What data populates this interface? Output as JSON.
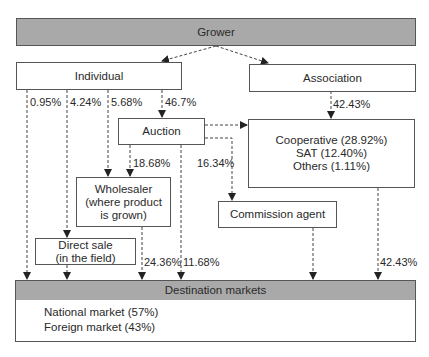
{
  "nodes": {
    "grower": "Grower",
    "individual": "Individual",
    "association": "Association",
    "auction": "Auction",
    "cooperative": [
      "Cooperative (28.92%)",
      "SAT (12.40%)",
      "Others (1.11%)"
    ],
    "wholesaler": [
      "Wholesaler",
      "(where product",
      "is grown)"
    ],
    "commission_agent": "Commission agent",
    "direct_sale": [
      "Direct sale",
      "(in the field)"
    ],
    "destination": "Destination markets",
    "markets": [
      "National market (57%)",
      "Foreign market (43%)"
    ]
  },
  "edges": {
    "ind_to_dest": "0.95%",
    "ind_to_direct": "4.24%",
    "ind_to_wholesaler": "5.68%",
    "ind_to_auction": "46.7%",
    "assoc_to_coop": "42.43%",
    "auction_to_wholesaler": "18.68%",
    "auction_to_commission": "16.34%",
    "wholesaler_to_dest": "24.36%",
    "auction_to_dest": "11.68%",
    "coop_to_dest": "42.43%"
  },
  "colors": {
    "header_fill": "#a9a9a9",
    "border": "#555555",
    "line": "#444444"
  }
}
